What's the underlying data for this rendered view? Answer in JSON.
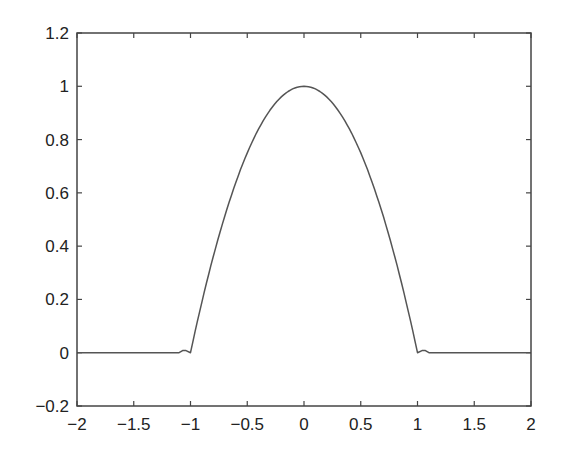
{
  "chart_data": {
    "type": "line",
    "title": "",
    "xlabel": "",
    "ylabel": "",
    "xlim": [
      -2,
      2
    ],
    "ylim": [
      -0.2,
      1.2
    ],
    "grid": false,
    "legend": null,
    "xticks": [
      -2,
      -1.5,
      -1,
      -0.5,
      0,
      0.5,
      1,
      1.5,
      2
    ],
    "xtick_labels": [
      "−2",
      "−1.5",
      "−1",
      "−0.5",
      "0",
      "0.5",
      "1",
      "1.5",
      "2"
    ],
    "yticks": [
      -0.2,
      0,
      0.2,
      0.4,
      0.6,
      0.8,
      1,
      1.2
    ],
    "ytick_labels": [
      "−0.2",
      "0",
      "0.2",
      "0.4",
      "0.6",
      "0.8",
      "1",
      "1.2"
    ],
    "series": [
      {
        "name": "f(x)",
        "color": "#555555",
        "x": [
          -2,
          -1.5,
          -1.1,
          -1.07,
          -1.04,
          -1.0,
          -0.9,
          -0.8,
          -0.7,
          -0.6,
          -0.5,
          -0.4,
          -0.3,
          -0.2,
          -0.1,
          0,
          0.1,
          0.2,
          0.3,
          0.4,
          0.5,
          0.6,
          0.7,
          0.8,
          0.9,
          1.0,
          1.04,
          1.07,
          1.1,
          1.5,
          2
        ],
        "y": [
          0,
          0,
          0,
          0.008,
          0.008,
          0,
          0.19,
          0.36,
          0.51,
          0.64,
          0.75,
          0.84,
          0.91,
          0.96,
          0.99,
          1.0,
          0.99,
          0.96,
          0.91,
          0.84,
          0.75,
          0.64,
          0.51,
          0.36,
          0.19,
          0,
          0.008,
          0.008,
          0,
          0,
          0
        ]
      }
    ]
  },
  "plot_area": {
    "left": 77,
    "top": 33,
    "right": 531,
    "bottom": 406
  }
}
